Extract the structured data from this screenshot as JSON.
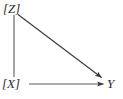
{
  "diagram": {
    "type": "causal-dag",
    "width": 123,
    "height": 99,
    "background_color": "#ffffff",
    "stroke_color": "#3a3a3a",
    "nodes": [
      {
        "id": "z",
        "label": "[Z]",
        "variable": "Z",
        "bracketed": true,
        "position": "top-left",
        "x": 14,
        "y": 9
      },
      {
        "id": "x",
        "label": "[X]",
        "variable": "X",
        "bracketed": true,
        "position": "bottom-left",
        "x": 14,
        "y": 85
      },
      {
        "id": "y",
        "label": "Y",
        "variable": "Y",
        "bracketed": false,
        "position": "bottom-right",
        "x": 113,
        "y": 85
      }
    ],
    "edges": [
      {
        "id": "z-x",
        "from": "z",
        "to": "x",
        "arrowhead": "none",
        "kind": "undirected-line",
        "orientation": "vertical",
        "x1": 14,
        "y1": 15,
        "x2": 14,
        "y2": 77
      },
      {
        "id": "z-y",
        "from": "z",
        "to": "y",
        "arrowhead": "solid-triangle",
        "kind": "directed-arrow",
        "orientation": "diagonal",
        "x1": 18,
        "y1": 15,
        "x2": 103,
        "y2": 79
      },
      {
        "id": "x-y",
        "from": "x",
        "to": "y",
        "arrowhead": "solid-triangle",
        "kind": "directed-arrow",
        "orientation": "horizontal",
        "x1": 29,
        "y1": 84,
        "x2": 105,
        "y2": 84
      }
    ]
  }
}
